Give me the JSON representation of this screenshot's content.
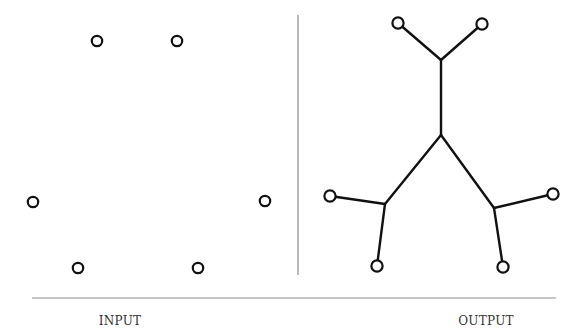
{
  "labels": {
    "input": "INPUT",
    "output": "OUTPUT"
  },
  "colors": {
    "stroke": "#111111",
    "divider": "#8a8a8a",
    "background": "#ffffff"
  },
  "input_panel": {
    "points": [
      {
        "x": 97,
        "y": 41
      },
      {
        "x": 177,
        "y": 41
      },
      {
        "x": 33,
        "y": 202
      },
      {
        "x": 265,
        "y": 201
      },
      {
        "x": 78,
        "y": 268
      },
      {
        "x": 198,
        "y": 268
      }
    ]
  },
  "output_panel": {
    "terminals": [
      {
        "id": "t1",
        "x": 398,
        "y": 23
      },
      {
        "id": "t2",
        "x": 482,
        "y": 24
      },
      {
        "id": "t3",
        "x": 330,
        "y": 196
      },
      {
        "id": "t4",
        "x": 553,
        "y": 194
      },
      {
        "id": "t5",
        "x": 377,
        "y": 266
      },
      {
        "id": "t6",
        "x": 503,
        "y": 267
      }
    ],
    "steiner_points": [
      {
        "id": "s1",
        "x": 441,
        "y": 60
      },
      {
        "id": "s2",
        "x": 441,
        "y": 135
      },
      {
        "id": "s3",
        "x": 385,
        "y": 204
      },
      {
        "id": "s4",
        "x": 494,
        "y": 208
      }
    ],
    "edges": [
      [
        "t1",
        "s1"
      ],
      [
        "t2",
        "s1"
      ],
      [
        "s1",
        "s2"
      ],
      [
        "s2",
        "s3"
      ],
      [
        "s2",
        "s4"
      ],
      [
        "t3",
        "s3"
      ],
      [
        "t5",
        "s3"
      ],
      [
        "t4",
        "s4"
      ],
      [
        "t6",
        "s4"
      ]
    ]
  },
  "dividers": {
    "vertical": {
      "x": 298,
      "y1": 15,
      "y2": 275
    },
    "horizontal": {
      "y": 298,
      "x1": 32,
      "x2": 556
    }
  }
}
